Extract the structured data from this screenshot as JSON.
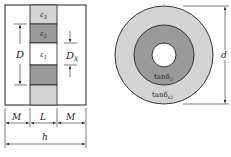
{
  "left_diagram": {
    "layers": [
      {
        "label": "ε",
        "sub": "3",
        "fill": "#d4d4d4"
      },
      {
        "label": "ε",
        "sub": "2",
        "fill": "#9a9a9a"
      },
      {
        "label": "ε",
        "sub": "1",
        "fill": "#ffffff"
      },
      {
        "label": "",
        "sub": "",
        "fill": "#9a9a9a"
      },
      {
        "label": "",
        "sub": "",
        "fill": "#d4d4d4"
      }
    ],
    "dim_D": "D",
    "dim_DX": "D",
    "dim_DX_sub": "X",
    "dim_M_left": "M",
    "dim_L": "L",
    "dim_M_right": "M",
    "dim_h": "h"
  },
  "right_diagram": {
    "outer_fill": "#d4d4d4",
    "middle_fill": "#9a9a9a",
    "inner_fill": "#ffffff",
    "inner_label": "tanδ",
    "inner_label_sub": "2",
    "outer_label": "tanδ",
    "outer_label_sub": "s3",
    "dim_d": "d"
  }
}
